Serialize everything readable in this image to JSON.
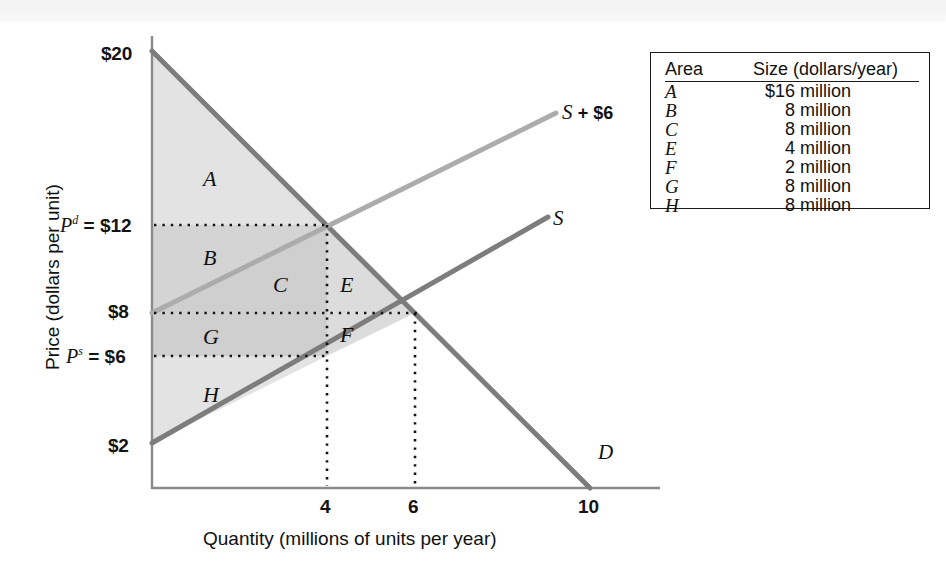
{
  "chart_data": {
    "type": "line",
    "title": "",
    "xlabel": "Quantity (millions of units per year)",
    "ylabel": "Price (dollars per unit)",
    "xlim": [
      0,
      11
    ],
    "ylim": [
      0,
      21
    ],
    "grid": false,
    "x_ticks": [
      "4",
      "6",
      "10"
    ],
    "x_tick_values": [
      4,
      6,
      10
    ],
    "y_ticks": [
      "$20",
      "$12",
      "$8",
      "$6",
      "$2"
    ],
    "y_tick_values": [
      20,
      12,
      8,
      6,
      2
    ],
    "series": [
      {
        "name": "D",
        "label": "D",
        "type": "line",
        "points": [
          [
            0,
            20
          ],
          [
            10,
            0
          ]
        ],
        "color": "#7a7a7a"
      },
      {
        "name": "S",
        "label": "S",
        "type": "line",
        "points": [
          [
            0,
            2
          ],
          [
            10,
            12
          ]
        ],
        "color": "#7a7a7a"
      },
      {
        "name": "S + $6",
        "label": "S + $6",
        "type": "line",
        "points": [
          [
            0,
            8
          ],
          [
            9,
            17
          ]
        ],
        "color": "#a8a8a8"
      }
    ],
    "annotations": [
      {
        "text": "A",
        "x": 1.9,
        "y": 16.0
      },
      {
        "text": "B",
        "x": 1.9,
        "y": 11.0
      },
      {
        "text": "C",
        "x": 3.0,
        "y": 9.3
      },
      {
        "text": "E",
        "x": 4.4,
        "y": 9.3
      },
      {
        "text": "G",
        "x": 1.9,
        "y": 7.0
      },
      {
        "text": "F",
        "x": 4.4,
        "y": 7.0
      },
      {
        "text": "H",
        "x": 1.9,
        "y": 4.0
      }
    ],
    "markers": {
      "equilibrium_quantity": 6,
      "equilibrium_price": 8,
      "tax_quantity": 4,
      "demand_price": 12,
      "supply_price": 6,
      "tax_amount": 6
    }
  },
  "axes": {
    "y_title": "Price (dollars per unit)",
    "x_title": "Quantity (millions of units per year)",
    "y_labels": {
      "top": "$20",
      "pd": "$12",
      "pd_prefix": "P",
      "pd_sup": "d",
      "pd_eq": "=",
      "mid": "$8",
      "ps": "$6",
      "ps_prefix": "P",
      "ps_sup": "s",
      "ps_eq": "=",
      "bottom": "$2"
    },
    "x_labels": [
      "4",
      "6",
      "10"
    ]
  },
  "curve_labels": {
    "supply_tax_italic": "S",
    "supply_tax_rest": "+ $6",
    "supply": "S",
    "demand": "D"
  },
  "regions": [
    {
      "id": "A",
      "label": "A"
    },
    {
      "id": "B",
      "label": "B"
    },
    {
      "id": "C",
      "label": "C"
    },
    {
      "id": "E",
      "label": "E"
    },
    {
      "id": "G",
      "label": "G"
    },
    {
      "id": "F",
      "label": "F"
    },
    {
      "id": "H",
      "label": "H"
    }
  ],
  "legend_table": {
    "header_area": "Area",
    "header_size": "Size (dollars/year)",
    "rows": [
      {
        "area": "A",
        "size": "$16 million",
        "amount": "$16",
        "unit": "million"
      },
      {
        "area": "B",
        "size": "8 million",
        "amount": "8",
        "unit": "million"
      },
      {
        "area": "C",
        "size": "8 million",
        "amount": "8",
        "unit": "million"
      },
      {
        "area": "E",
        "size": "4 million",
        "amount": "4",
        "unit": "million"
      },
      {
        "area": "F",
        "size": "2 million",
        "amount": "2",
        "unit": "million"
      },
      {
        "area": "G",
        "size": "8 million",
        "amount": "8",
        "unit": "million"
      },
      {
        "area": "H",
        "size": "8 million",
        "amount": "8",
        "unit": "million"
      }
    ]
  },
  "colors": {
    "shade_light": "#e3e3e3",
    "shade_dark": "#cfcfcf",
    "curve_dark": "#7d7d7d",
    "curve_light": "#acacac",
    "axis": "#8a8a8a",
    "text": "#141414"
  }
}
